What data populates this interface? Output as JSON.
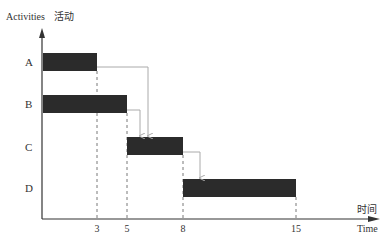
{
  "y_axis": {
    "label": "Activities",
    "label_cn": "活动"
  },
  "x_axis": {
    "label": "Time",
    "label_cn": "时间",
    "ticks": [
      "3",
      "5",
      "8",
      "15"
    ]
  },
  "activities": [
    {
      "name": "A",
      "start": 0,
      "end": 3
    },
    {
      "name": "B",
      "start": 0,
      "end": 5
    },
    {
      "name": "C",
      "start": 5,
      "end": 8
    },
    {
      "name": "D",
      "start": 8,
      "end": 15
    }
  ],
  "dependencies": [
    {
      "from": "A",
      "to": "C"
    },
    {
      "from": "B",
      "to": "C"
    },
    {
      "from": "C",
      "to": "D"
    }
  ],
  "colors": {
    "bar": "#2b2b2b",
    "axis": "#333333",
    "arrow": "#aaaaaa",
    "guide": "#555555"
  }
}
